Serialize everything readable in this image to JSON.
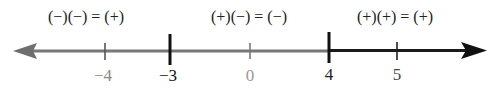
{
  "diagram": {
    "type": "number-line-sign-chart",
    "colors": {
      "gray": "#707070",
      "dark": "#1a1a1a",
      "label_gray": "#888888"
    },
    "intervals": [
      {
        "rule": "(−)(−) = (+)",
        "x": 86
      },
      {
        "rule": "(+)(−) = (−)",
        "x": 249
      },
      {
        "rule": "(+)(+) = (+)",
        "x": 395
      }
    ],
    "ticks": [
      {
        "label": "−4",
        "x": 105,
        "critical": false
      },
      {
        "label": "−3",
        "x": 170,
        "critical": true
      },
      {
        "label": "0",
        "x": 250,
        "critical": false
      },
      {
        "label": "4",
        "x": 329,
        "critical": true
      },
      {
        "label": "5",
        "x": 397,
        "critical": false
      }
    ]
  }
}
